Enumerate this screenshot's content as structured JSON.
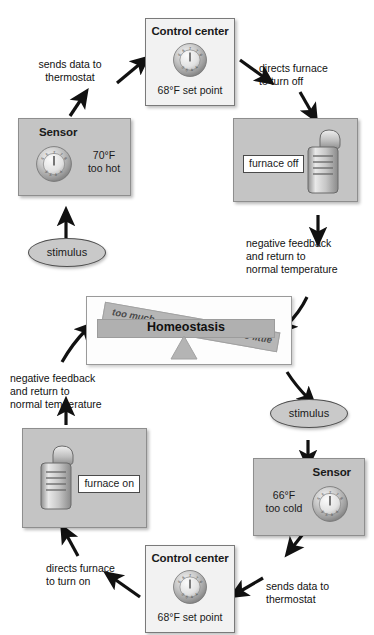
{
  "diagram": {
    "center": {
      "label": "Homeostasis",
      "left_label": "too much",
      "right_label": "too little"
    },
    "nodes": {
      "control_center_top": {
        "title": "Control center",
        "setpoint": "68°F set point",
        "icon": "thermostat-dial-icon"
      },
      "control_center_bottom": {
        "title": "Control center",
        "setpoint": "68°F set point",
        "icon": "thermostat-dial-icon"
      },
      "sensor_top": {
        "title": "Sensor",
        "value": "70°F",
        "state": "too hot",
        "icon": "thermostat-dial-icon"
      },
      "sensor_bottom": {
        "title": "Sensor",
        "value": "66°F",
        "state": "too cold",
        "icon": "thermostat-dial-icon"
      },
      "furnace_off": {
        "label": "furnace off",
        "icon": "furnace-icon"
      },
      "furnace_on": {
        "label": "furnace on",
        "icon": "furnace-icon"
      },
      "stimulus_left": {
        "label": "stimulus"
      },
      "stimulus_right": {
        "label": "stimulus"
      }
    },
    "captions": {
      "sends_data_top": "sends data to\nthermostat",
      "directs_off": "directs furnace\nto turn off",
      "negative_feedback_right": "negative feedback\nand return to\nnormal temperature",
      "negative_feedback_left": "negative feedback\nand return to\nnormal temperature",
      "directs_on": "directs furnace\nto turn on",
      "sends_data_bottom": "sends data to\nthermostat"
    },
    "colors": {
      "box_gray": "#c4c4c4",
      "box_white": "#f2f2f2",
      "beam_gray": "#b6b6b6",
      "arrow": "#111111",
      "page_bg": "#ffffff"
    }
  }
}
